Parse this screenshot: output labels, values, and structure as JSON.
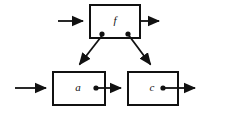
{
  "diagram": {
    "background_color": "#ffffff",
    "stroke_color": "#111111",
    "blocks": [
      {
        "id": "f",
        "label": "f",
        "position": "top-center",
        "x": 90,
        "y": 5,
        "width": 50,
        "height": 33
      },
      {
        "id": "a",
        "label": "a",
        "position": "bottom-left",
        "x": 53,
        "y": 72,
        "width": 52,
        "height": 33
      },
      {
        "id": "c",
        "label": "c",
        "position": "bottom-right",
        "x": 128,
        "y": 72,
        "width": 50,
        "height": 33
      }
    ],
    "connections": [
      {
        "id": "input-to-f",
        "from": "external-input",
        "to": "f",
        "type": "arrow",
        "orientation": "horizontal"
      },
      {
        "id": "f-to-output",
        "from": "f",
        "to": "external-output",
        "type": "arrow",
        "orientation": "horizontal"
      },
      {
        "id": "f-branch-to-a",
        "from": "f",
        "to": "a",
        "type": "arrow",
        "orientation": "diagonal-left"
      },
      {
        "id": "f-branch-to-c",
        "from": "f",
        "to": "c",
        "type": "arrow",
        "orientation": "diagonal-right"
      },
      {
        "id": "input-to-a",
        "from": "external-input",
        "to": "a",
        "type": "arrow",
        "orientation": "horizontal"
      },
      {
        "id": "a-to-c",
        "from": "a",
        "to": "c",
        "type": "arrow",
        "orientation": "horizontal"
      },
      {
        "id": "c-to-output",
        "from": "c",
        "to": "external-output",
        "type": "arrow",
        "orientation": "horizontal"
      }
    ],
    "junctions": [
      {
        "id": "f-left-tap",
        "on_block": "f",
        "x": 102,
        "y": 34
      },
      {
        "id": "f-right-tap",
        "on_block": "f",
        "x": 128,
        "y": 34
      },
      {
        "id": "a-output-tap",
        "on_block": "a",
        "x": 96,
        "y": 88
      },
      {
        "id": "c-output-tap",
        "on_block": "c",
        "x": 163,
        "y": 88
      }
    ]
  }
}
